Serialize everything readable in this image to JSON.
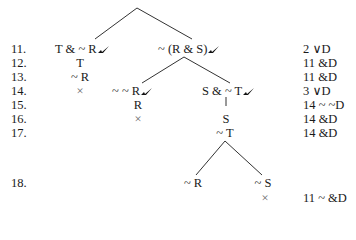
{
  "line_numbers": [
    "11.",
    "12.",
    "13.",
    "14.",
    "15.",
    "16.",
    "17.",
    "18."
  ],
  "justifications": [
    "2 ∨D",
    "11 &D",
    "11 &D",
    "3 ∨D",
    "14 ~ ~D",
    "14 &D",
    "14 &D",
    "11 ~ &D"
  ],
  "tree": {
    "left_branch": {
      "n11": "T & ~ R",
      "n12": "T",
      "n13": "~ R",
      "n14_close": "×"
    },
    "right_branch": {
      "n11": "~ (R & S)",
      "left_child": {
        "n14": "~ ~ R",
        "n15": "R",
        "n16_close": "×"
      },
      "right_child": {
        "n14": "S & ~ T",
        "n16": "S",
        "n17": "~ T",
        "n18_left": "~ R",
        "n18_right": "~ S",
        "close": "×"
      }
    },
    "check_mark": "checked-icon"
  }
}
